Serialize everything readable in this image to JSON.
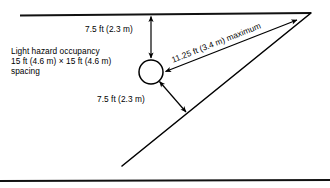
{
  "figure": {
    "name": "sprinkler-spacing-diagram",
    "background_color": "#ffffff",
    "line_color": "#000000"
  },
  "labels": {
    "occupancy": {
      "line1": "Light hazard occupancy",
      "line2": "15 ft (4.6 m) × 15 ft (4.6 m)",
      "line3": "spacing"
    },
    "top_dimension": "7.5 ft (2.3 m)",
    "bottom_dimension": "7.5 ft (2.3 m)",
    "diagonal_dimension": "11.25 ft (3.4 m) maximum"
  },
  "geometry": {
    "top_wall": {
      "x1": 20,
      "y1": 15.5,
      "x2": 311,
      "y2": 13
    },
    "bottom_wall": {
      "x1": 0,
      "y1": 181,
      "x2": 330,
      "y2": 180
    },
    "diagonal_wall": {
      "x1": 122,
      "y1": 166,
      "x2": 311,
      "y2": 13
    },
    "sprinkler": {
      "cx": 151,
      "cy": 72,
      "r": 12
    },
    "vertical_dimension_arrow": {
      "x1": 151,
      "y1": 15.5,
      "x2": 151,
      "y2": 59
    },
    "diagonal_dimension_arrow": {
      "x1": 297,
      "y1": 20,
      "x2": 164,
      "y2": 72
    },
    "lower_dimension_arrow": {
      "x1": 159,
      "y1": 82,
      "x2": 187,
      "y2": 113
    }
  }
}
